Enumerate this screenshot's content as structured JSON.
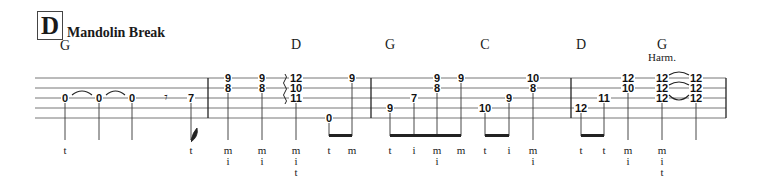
{
  "section": {
    "letter": "D",
    "title": "Mandolin Break"
  },
  "chords": [
    {
      "label": "G",
      "x": 65,
      "y": 46
    },
    {
      "label": "D",
      "x": 296,
      "y": 45
    },
    {
      "label": "G",
      "x": 390,
      "y": 45
    },
    {
      "label": "C",
      "x": 485,
      "y": 45
    },
    {
      "label": "D",
      "x": 581,
      "y": 45
    },
    {
      "label": "G",
      "x": 662,
      "y": 45
    }
  ],
  "annotation": {
    "label": "Harm.",
    "x": 662,
    "y": 59
  },
  "staff": {
    "x_start": 35,
    "x_end": 726,
    "lines_y": [
      78,
      88,
      98,
      108,
      118
    ]
  },
  "barlines": [
    208,
    371,
    571,
    726
  ],
  "measures": [
    {
      "notes": [
        {
          "x": 65,
          "frets": [
            {
              "line": 2,
              "fret": "0"
            }
          ],
          "finger": [
            "t"
          ]
        },
        {
          "x": 99,
          "frets": [
            {
              "line": 2,
              "fret": "0"
            }
          ],
          "finger": []
        },
        {
          "x": 132,
          "frets": [
            {
              "line": 2,
              "fret": "0"
            }
          ],
          "finger": []
        },
        {
          "x": 166,
          "rest": "eighth"
        },
        {
          "x": 191,
          "frets": [
            {
              "line": 2,
              "fret": "7"
            }
          ],
          "finger": [
            "t"
          ],
          "flag": true
        }
      ],
      "ties": [
        [
          65,
          99,
          2
        ],
        [
          99,
          132,
          2
        ]
      ]
    },
    {
      "notes": [
        {
          "x": 228,
          "frets": [
            {
              "line": 0,
              "fret": "9"
            },
            {
              "line": 1,
              "fret": "8"
            }
          ],
          "finger": [
            "m",
            "i"
          ]
        },
        {
          "x": 262,
          "frets": [
            {
              "line": 0,
              "fret": "9"
            },
            {
              "line": 1,
              "fret": "8"
            }
          ],
          "finger": [
            "m",
            "i"
          ]
        },
        {
          "x": 296,
          "frets": [
            {
              "line": 0,
              "fret": "12"
            },
            {
              "line": 1,
              "fret": "10"
            },
            {
              "line": 2,
              "fret": "11"
            }
          ],
          "finger": [
            "m",
            "i",
            "t"
          ],
          "arpeggio": true
        },
        {
          "x": 329,
          "frets": [
            {
              "line": 4,
              "fret": "0"
            }
          ],
          "finger": [
            "t"
          ]
        },
        {
          "x": 352,
          "frets": [
            {
              "line": 0,
              "fret": "9"
            }
          ],
          "finger": [
            "m"
          ]
        }
      ],
      "beams": [
        [
          329,
          352
        ]
      ]
    },
    {
      "notes": [
        {
          "x": 390,
          "frets": [
            {
              "line": 3,
              "fret": "9"
            }
          ],
          "finger": [
            "t"
          ]
        },
        {
          "x": 414,
          "frets": [
            {
              "line": 2,
              "fret": "7"
            }
          ],
          "finger": [
            "i"
          ]
        },
        {
          "x": 437,
          "frets": [
            {
              "line": 0,
              "fret": "9"
            },
            {
              "line": 1,
              "fret": "8"
            }
          ],
          "finger": [
            "m",
            "i"
          ]
        },
        {
          "x": 461,
          "frets": [
            {
              "line": 0,
              "fret": "9"
            }
          ],
          "finger": [
            "m"
          ]
        },
        {
          "x": 485,
          "frets": [
            {
              "line": 3,
              "fret": "10"
            }
          ],
          "finger": [
            "t"
          ]
        },
        {
          "x": 509,
          "frets": [
            {
              "line": 2,
              "fret": "9"
            }
          ],
          "finger": [
            "i"
          ]
        },
        {
          "x": 533,
          "frets": [
            {
              "line": 0,
              "fret": "10"
            },
            {
              "line": 1,
              "fret": "8"
            }
          ],
          "finger": [
            "m",
            "i"
          ]
        }
      ],
      "beams": [
        [
          390,
          461
        ],
        [
          485,
          509
        ]
      ]
    },
    {
      "notes": [
        {
          "x": 581,
          "frets": [
            {
              "line": 3,
              "fret": "12"
            }
          ],
          "finger": [
            "t"
          ]
        },
        {
          "x": 604,
          "frets": [
            {
              "line": 2,
              "fret": "11"
            }
          ],
          "finger": [
            "t"
          ]
        },
        {
          "x": 628,
          "frets": [
            {
              "line": 0,
              "fret": "12"
            },
            {
              "line": 1,
              "fret": "10"
            }
          ],
          "finger": [
            "m",
            "i"
          ]
        },
        {
          "x": 662,
          "frets": [
            {
              "line": 0,
              "fret": "12"
            },
            {
              "line": 1,
              "fret": "12"
            },
            {
              "line": 2,
              "fret": "12"
            }
          ],
          "finger": [
            "m",
            "i",
            "t"
          ]
        },
        {
          "x": 696,
          "frets": [
            {
              "line": 0,
              "fret": "12"
            },
            {
              "line": 1,
              "fret": "12"
            },
            {
              "line": 2,
              "fret": "12"
            }
          ],
          "finger": []
        }
      ],
      "beams": [
        [
          581,
          604
        ]
      ],
      "ties": [
        [
          662,
          696,
          0
        ],
        [
          662,
          696,
          1
        ],
        [
          662,
          696,
          2
        ]
      ]
    }
  ]
}
